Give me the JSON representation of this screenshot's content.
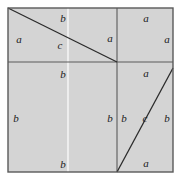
{
  "figure": {
    "type": "geometric-diagram",
    "colors": {
      "background": "#ffffff",
      "fill": "#d4d4d4",
      "stroke": "#4a4a4a",
      "diagonal_stroke": "#2b2b2b",
      "label_color": "#1a1a1a",
      "seam": "#f2f2f2"
    },
    "outer_square": {
      "x": 8,
      "y": 8,
      "width": 165,
      "height": 164
    },
    "dividers": {
      "vertical_x": 117,
      "horizontal_y": 62,
      "seam_x": 68
    },
    "diagonals": [
      {
        "name": "upper-left-hypotenuse",
        "x1": 8,
        "y1": 8,
        "x2": 117,
        "y2": 62
      },
      {
        "name": "lower-right-hypotenuse",
        "x1": 117,
        "y1": 172,
        "x2": 173,
        "y2": 68
      }
    ],
    "labels": [
      {
        "name": "label-upper-left-a-left",
        "text": "a",
        "x": 19,
        "y": 39
      },
      {
        "name": "label-upper-left-b-top",
        "text": "b",
        "x": 63,
        "y": 18
      },
      {
        "name": "label-upper-left-c-diag",
        "text": "c",
        "x": 60,
        "y": 45
      },
      {
        "name": "label-upper-left-a-right",
        "text": "a",
        "x": 110,
        "y": 38
      },
      {
        "name": "label-upper-right-a-top",
        "text": "a",
        "x": 146,
        "y": 18
      },
      {
        "name": "label-upper-right-a-right",
        "text": "a",
        "x": 167,
        "y": 39
      },
      {
        "name": "label-lower-left-b-top",
        "text": "b",
        "x": 63,
        "y": 74
      },
      {
        "name": "label-lower-left-b-left",
        "text": "b",
        "x": 16,
        "y": 118
      },
      {
        "name": "label-lower-left-b-right",
        "text": "b",
        "x": 110,
        "y": 118
      },
      {
        "name": "label-lower-left-b-bottom",
        "text": "b",
        "x": 63,
        "y": 164
      },
      {
        "name": "label-lower-right-a-top",
        "text": "a",
        "x": 146,
        "y": 73
      },
      {
        "name": "label-lower-right-b-left",
        "text": "b",
        "x": 124,
        "y": 118
      },
      {
        "name": "label-lower-right-c-diag",
        "text": "c",
        "x": 145,
        "y": 118
      },
      {
        "name": "label-lower-right-b-right",
        "text": "b",
        "x": 167,
        "y": 118
      },
      {
        "name": "label-lower-right-a-bottom",
        "text": "a",
        "x": 146,
        "y": 163
      }
    ]
  }
}
